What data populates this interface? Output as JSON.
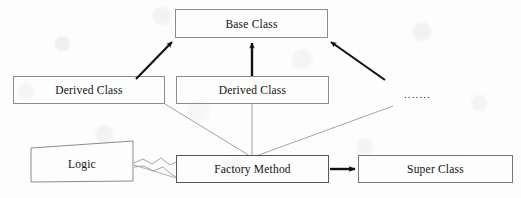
{
  "diagram": {
    "background_color": "#fdfdfd",
    "line_color": "#8a8a8a",
    "thick_line_color": "#111111",
    "text_color": "#111111",
    "nodes": {
      "base_class": {
        "label": "Base Class",
        "x": 175,
        "y": 9,
        "width": 153,
        "height": 29
      },
      "derived_class_left": {
        "label": "Derived Class",
        "x": 13,
        "y": 76,
        "width": 152,
        "height": 28
      },
      "derived_class_middle": {
        "label": "Derived Class",
        "x": 176,
        "y": 76,
        "width": 153,
        "height": 28
      },
      "logic": {
        "label": "Logic",
        "points": "31,148 133,141 133,181 31,182"
      },
      "factory_method": {
        "label": "Factory Method",
        "x": 176,
        "y": 155,
        "width": 153,
        "height": 28
      },
      "super_class": {
        "label": "Super Class",
        "x": 358,
        "y": 155,
        "width": 155,
        "height": 28
      }
    },
    "ellipsis": {
      "label": "· · · · · · ·",
      "text": ".......",
      "x": 404,
      "y": 88
    },
    "edges": [
      {
        "name": "derived-left-to-base",
        "kind": "inheritance-arrow-thick",
        "from": "derived_class_left",
        "to": "base_class"
      },
      {
        "name": "derived-middle-to-base",
        "kind": "inheritance-arrow-thick",
        "from": "derived_class_middle",
        "to": "base_class"
      },
      {
        "name": "others-to-base",
        "kind": "inheritance-arrow-thick",
        "from": "ellipsis",
        "to": "base_class"
      },
      {
        "name": "factory-to-derived-left",
        "kind": "thin-line",
        "from": "factory_method",
        "to": "derived_class_left"
      },
      {
        "name": "factory-to-derived-middle",
        "kind": "thin-line",
        "from": "factory_method",
        "to": "derived_class_middle"
      },
      {
        "name": "factory-to-others",
        "kind": "thin-line",
        "from": "factory_method",
        "to": "ellipsis"
      },
      {
        "name": "logic-to-factory",
        "kind": "zigzag-connector",
        "from": "logic",
        "to": "factory_method"
      },
      {
        "name": "factory-to-super",
        "kind": "arrow-thick",
        "from": "factory_method",
        "to": "super_class"
      }
    ]
  }
}
